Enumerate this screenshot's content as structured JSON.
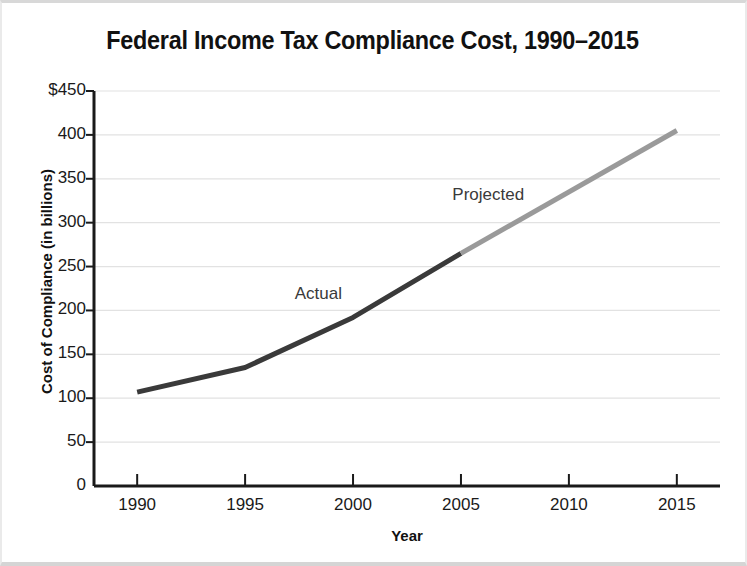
{
  "chart_data": {
    "type": "line",
    "title": "Federal Income Tax Compliance Cost, 1990–2015",
    "xlabel": "Year",
    "ylabel": "Cost of Compliance (in billions)",
    "x": [
      1990,
      1995,
      2000,
      2005,
      2010,
      2015
    ],
    "xtick_labels": [
      "1990",
      "1995",
      "2000",
      "2005",
      "2010",
      "2015"
    ],
    "ytick_labels": [
      "$450",
      "400",
      "350",
      "300",
      "250",
      "200",
      "150",
      "100",
      "50",
      "0"
    ],
    "ytick_values": [
      450,
      400,
      350,
      300,
      250,
      200,
      150,
      100,
      50,
      0
    ],
    "xlim": [
      1988,
      2017
    ],
    "ylim": [
      0,
      450
    ],
    "grid": true,
    "grid_color": "#e2e2e2",
    "legend": "none",
    "series": [
      {
        "name": "Actual",
        "color": "#3a3a3a",
        "x": [
          1990,
          1995,
          2000,
          2005
        ],
        "values": [
          107,
          135,
          192,
          265
        ]
      },
      {
        "name": "Projected",
        "color": "#9a9a9a",
        "x": [
          2005,
          2015
        ],
        "values": [
          265,
          405
        ]
      }
    ],
    "annotations": [
      {
        "text": "Actual",
        "x": 1997.3,
        "y": 218
      },
      {
        "text": "Projected",
        "x": 2004.6,
        "y": 330
      }
    ]
  },
  "axis": {
    "axis_color": "#1a1a1a"
  }
}
